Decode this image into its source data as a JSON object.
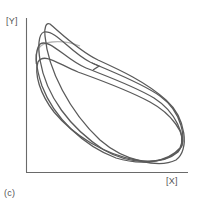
{
  "figure": {
    "panel_label": "(c)",
    "x_axis_label": "[X]",
    "y_axis_label": "[Y]",
    "colors": {
      "curve": "#5a5a5a",
      "light_curve": "#b5b5b5",
      "axis": "#6a6a6a",
      "text": "#555555",
      "background": "#ffffff"
    },
    "loop_count": 4,
    "has_direction_arrow": true
  }
}
